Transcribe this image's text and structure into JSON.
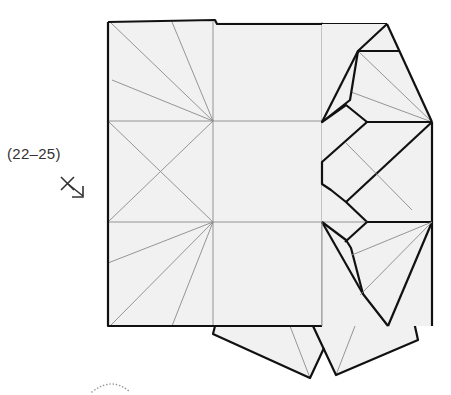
{
  "diagram": {
    "type": "origami-step",
    "step_reference": "(22–25)",
    "symbol": "mountain-fold-arrow",
    "colors": {
      "paper": "#f1f1f1",
      "crease": "#8a8a8a",
      "edge": "#111111",
      "label": "#333333"
    }
  }
}
